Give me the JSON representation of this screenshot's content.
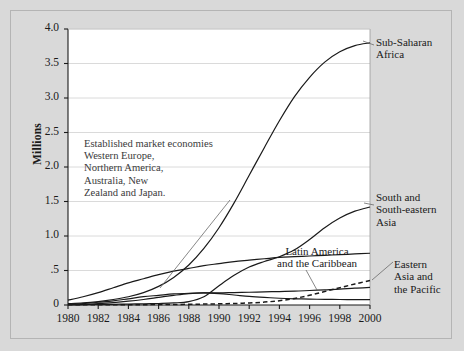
{
  "figure": {
    "background_color": "#d9d9d9",
    "plot_background_color": "#ffffff",
    "border_color": "#b4b4b4",
    "line_color": "#1a1a1a",
    "grid_color": "#d0d0d0"
  },
  "axes": {
    "ylabel": "Millions",
    "y_ticks": [
      "0",
      ".5",
      "1.0",
      "1.5",
      "2.0",
      "2.5",
      "3.0",
      "3.5",
      "4.0"
    ],
    "y_tick_values": [
      0,
      0.5,
      1.0,
      1.5,
      2.0,
      2.5,
      3.0,
      3.5,
      4.0
    ],
    "ylim": [
      0,
      4.0
    ],
    "x_ticks": [
      "1980",
      "1982",
      "1984",
      "1986",
      "1988",
      "1990",
      "1992",
      "1994",
      "1996",
      "1998",
      "2000"
    ],
    "x_tick_values": [
      1980,
      1982,
      1984,
      1986,
      1988,
      1990,
      1992,
      1994,
      1996,
      1998,
      2000
    ],
    "xlim": [
      1980,
      2000
    ],
    "grid": "horizontal"
  },
  "annotations": {
    "established_market_economies": [
      "Established market economies",
      "Western Europe,",
      "Northern America,",
      "Australia, New",
      "Zealand and Japan."
    ]
  },
  "series_labels": {
    "sub_saharan_africa": [
      "Sub-Saharan",
      "Africa"
    ],
    "south_and_south_eastern_asia": [
      "South and",
      "South-eastern",
      "Asia"
    ],
    "latin_america_and_the_caribbean": [
      "Latin America",
      "and the Caribbean"
    ],
    "eastern_asia_and_the_pacific": [
      "Eastern",
      "Asia and",
      "the Pacific"
    ]
  },
  "chart_data": {
    "type": "line",
    "title": "",
    "xlabel": "",
    "ylabel": "Millions",
    "xlim": [
      1980,
      2000
    ],
    "ylim": [
      0,
      4.0
    ],
    "grid": "horizontal",
    "legend": "inline-right-labels",
    "x": [
      1980,
      1981,
      1982,
      1983,
      1984,
      1985,
      1986,
      1987,
      1988,
      1989,
      1990,
      1991,
      1992,
      1993,
      1994,
      1995,
      1996,
      1997,
      1998,
      1999,
      2000
    ],
    "series": [
      {
        "name": "Sub-Saharan Africa",
        "style": "solid",
        "label_position": "right",
        "values": [
          0.02,
          0.03,
          0.05,
          0.08,
          0.12,
          0.18,
          0.27,
          0.4,
          0.58,
          0.82,
          1.12,
          1.48,
          1.88,
          2.28,
          2.67,
          3.02,
          3.3,
          3.52,
          3.67,
          3.76,
          3.8
        ]
      },
      {
        "name": "South and South-eastern Asia",
        "style": "solid",
        "label_position": "right",
        "values": [
          0.005,
          0.006,
          0.008,
          0.01,
          0.013,
          0.017,
          0.022,
          0.03,
          0.05,
          0.12,
          0.28,
          0.43,
          0.55,
          0.63,
          0.7,
          0.8,
          0.95,
          1.12,
          1.26,
          1.36,
          1.42
        ]
      },
      {
        "name": "Established market economies Western Europe, Northern America, Australia, New Zealand and Japan.",
        "style": "solid",
        "label_position": "annotation",
        "values": [
          0.07,
          0.12,
          0.18,
          0.25,
          0.32,
          0.38,
          0.44,
          0.49,
          0.53,
          0.57,
          0.6,
          0.63,
          0.65,
          0.67,
          0.69,
          0.7,
          0.71,
          0.72,
          0.73,
          0.74,
          0.75
        ]
      },
      {
        "name": "Latin America and the Caribbean",
        "style": "solid",
        "label_position": "leader",
        "values": [
          0.01,
          0.02,
          0.04,
          0.06,
          0.09,
          0.12,
          0.14,
          0.16,
          0.17,
          0.175,
          0.175,
          0.18,
          0.185,
          0.19,
          0.195,
          0.2,
          0.21,
          0.22,
          0.23,
          0.245,
          0.255
        ]
      },
      {
        "name": "Eastern Asia and the Pacific",
        "style": "dashed",
        "label_position": "right",
        "values": [
          0.002,
          0.002,
          0.003,
          0.003,
          0.004,
          0.005,
          0.006,
          0.008,
          0.01,
          0.013,
          0.017,
          0.022,
          0.03,
          0.042,
          0.062,
          0.095,
          0.14,
          0.195,
          0.25,
          0.305,
          0.355
        ]
      },
      {
        "name": "unlabeled lower curve",
        "style": "solid",
        "label_position": "none",
        "values": [
          0.005,
          0.01,
          0.02,
          0.035,
          0.055,
          0.08,
          0.11,
          0.14,
          0.165,
          0.175,
          0.165,
          0.145,
          0.125,
          0.11,
          0.098,
          0.09,
          0.085,
          0.082,
          0.08,
          0.078,
          0.077
        ]
      }
    ]
  }
}
